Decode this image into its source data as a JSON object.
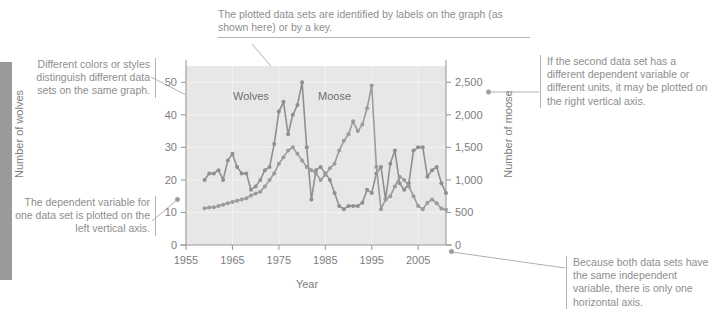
{
  "figure": {
    "callouts": [
      {
        "id": "colors",
        "text": "Different colors or styles distinguish different data sets on the same graph."
      },
      {
        "id": "dependent-variable",
        "text": "The dependent variable for one data set is plotted on the left vertical axis."
      },
      {
        "id": "labels",
        "text": "The plotted data sets are identified by labels on the graph (as shown here) or by a key."
      },
      {
        "id": "right-axis",
        "text": "If the second data set has a different dependent variable or different units, it may be plotted on the right vertical axis."
      },
      {
        "id": "horizontal-axis",
        "text": "Because both data sets have the same independent variable, there is only one horizontal axis."
      }
    ]
  },
  "chart_data": {
    "type": "line",
    "title": "",
    "xlabel": "Year",
    "ylabel": "Number of wolves",
    "y2label": "Number of moose",
    "xlim": [
      1955,
      2011
    ],
    "ylim": [
      0,
      55
    ],
    "y2lim": [
      0,
      2750
    ],
    "xticks": [
      1955,
      1965,
      1975,
      1985,
      1995,
      2005
    ],
    "xticklabels": [
      "1955",
      "1965",
      "1975",
      "1985",
      "1995",
      "2005"
    ],
    "yticks": [
      0,
      10,
      20,
      30,
      40,
      50
    ],
    "yticklabels": [
      "0",
      "10",
      "20",
      "30",
      "40",
      "50"
    ],
    "y2ticks": [
      0,
      500,
      1000,
      1500,
      2000,
      2500
    ],
    "y2ticklabels": [
      "0",
      "500",
      "1,000",
      "1,500",
      "2,000",
      "2,500"
    ],
    "grid": true,
    "legend_position": "inline-labels",
    "annotations": [
      {
        "text": "Wolves",
        "x": 1973.5,
        "axis": "left"
      },
      {
        "text": "Moose",
        "x": 1988.5,
        "axis": "left"
      }
    ],
    "colors": {
      "wolves": "#8f8f8f",
      "moose": "#9b9b9b",
      "plot_background": "#e7e7e7",
      "axis": "#9a9a9a"
    },
    "series": [
      {
        "name": "Wolves",
        "axis": "left",
        "unit": "wolves",
        "x": [
          1959,
          1960,
          1961,
          1962,
          1963,
          1964,
          1965,
          1966,
          1967,
          1968,
          1969,
          1970,
          1971,
          1972,
          1973,
          1974,
          1975,
          1976,
          1977,
          1978,
          1979,
          1980,
          1981,
          1982,
          1983,
          1984,
          1985,
          1986,
          1987,
          1988,
          1989,
          1990,
          1991,
          1992,
          1993,
          1994,
          1995,
          1996,
          1997,
          1998,
          1999,
          2000,
          2001,
          2002,
          2003,
          2004,
          2005,
          2006,
          2007,
          2008,
          2009,
          2010,
          2011
        ],
        "values": [
          20,
          22,
          22,
          23,
          20,
          26,
          28,
          24,
          22,
          22,
          17,
          18,
          20,
          23,
          24,
          31,
          41,
          44,
          34,
          40,
          43,
          50,
          30,
          14,
          23,
          24,
          22,
          20,
          16,
          12,
          11,
          12,
          12,
          12,
          13,
          17,
          16,
          22,
          24,
          14,
          25,
          29,
          19,
          17,
          19,
          29,
          30,
          30,
          21,
          23,
          24,
          19,
          16
        ]
      },
      {
        "name": "Moose",
        "axis": "right",
        "unit": "moose",
        "x": [
          1959,
          1960,
          1961,
          1962,
          1963,
          1964,
          1965,
          1966,
          1967,
          1968,
          1969,
          1970,
          1971,
          1972,
          1973,
          1974,
          1975,
          1976,
          1977,
          1978,
          1979,
          1980,
          1981,
          1982,
          1983,
          1984,
          1985,
          1986,
          1987,
          1988,
          1989,
          1990,
          1991,
          1992,
          1993,
          1994,
          1995,
          1996,
          1997,
          1998,
          1999,
          2000,
          2001,
          2002,
          2003,
          2004,
          2005,
          2006,
          2007,
          2008,
          2009,
          2010,
          2011
        ],
        "values": [
          565,
          575,
          580,
          600,
          620,
          640,
          660,
          680,
          700,
          720,
          760,
          790,
          820,
          900,
          1000,
          1100,
          1250,
          1350,
          1450,
          1500,
          1400,
          1300,
          1200,
          1150,
          1100,
          1000,
          1080,
          1180,
          1250,
          1450,
          1600,
          1700,
          1900,
          1750,
          1850,
          2100,
          2450,
          1200,
          550,
          700,
          750,
          900,
          1050,
          1000,
          900,
          750,
          600,
          550,
          650,
          700,
          640,
          560,
          540
        ]
      }
    ]
  }
}
